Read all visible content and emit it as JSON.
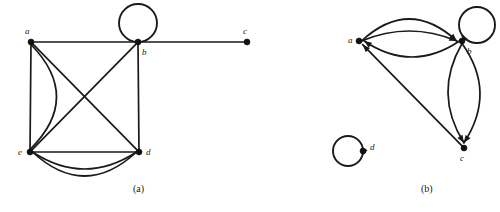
{
  "figure": {
    "panels": [
      {
        "id": "a",
        "caption": "(a)",
        "caption_x": 133,
        "caption_y": 183,
        "graph_type": "undirected multigraph",
        "vertices": [
          {
            "id": "a",
            "label": "a",
            "x": 31,
            "y": 42,
            "label_x": 25,
            "label_y": 27
          },
          {
            "id": "b",
            "label": "b",
            "x": 138,
            "y": 42,
            "label_x": 142,
            "label_y": 48
          },
          {
            "id": "c",
            "label": "c",
            "x": 247,
            "y": 42,
            "label_x": 243,
            "label_y": 27
          },
          {
            "id": "d",
            "label": "d",
            "x": 139,
            "y": 152,
            "label_x": 146,
            "label_y": 148
          },
          {
            "id": "e",
            "label": "e",
            "x": 30,
            "y": 152,
            "label_x": 18,
            "label_y": 148
          }
        ],
        "edges": [
          {
            "from": "a",
            "to": "b",
            "kind": "straight"
          },
          {
            "from": "b",
            "to": "c",
            "kind": "straight"
          },
          {
            "from": "a",
            "to": "e",
            "kind": "straight"
          },
          {
            "from": "a",
            "to": "e",
            "kind": "curve",
            "bow": -26
          },
          {
            "from": "a",
            "to": "d",
            "kind": "straight"
          },
          {
            "from": "b",
            "to": "e",
            "kind": "straight"
          },
          {
            "from": "b",
            "to": "d",
            "kind": "straight"
          },
          {
            "from": "e",
            "to": "d",
            "kind": "straight"
          },
          {
            "from": "e",
            "to": "d",
            "kind": "curve",
            "bow": 17
          },
          {
            "from": "e",
            "to": "d",
            "kind": "curve",
            "bow": 24
          }
        ],
        "loops": [
          {
            "at": "b",
            "cx": 138,
            "cy": 23,
            "r": 19
          }
        ]
      },
      {
        "id": "b",
        "caption": "(b)",
        "caption_x": 161,
        "caption_y": 183,
        "graph_type": "directed multigraph",
        "vertices": [
          {
            "id": "a",
            "label": "a",
            "x": 99,
            "y": 41,
            "label_x": 88,
            "label_y": 36
          },
          {
            "id": "b",
            "label": "b",
            "x": 202,
            "y": 41,
            "label_x": 207,
            "label_y": 47
          },
          {
            "id": "c",
            "label": "c",
            "x": 204,
            "y": 148,
            "label_x": 200,
            "label_y": 154
          },
          {
            "id": "d",
            "label": "d",
            "x": 103,
            "y": 151,
            "label_x": 110,
            "label_y": 143
          }
        ],
        "edges": [
          {
            "from": "a",
            "to": "b",
            "kind": "curve",
            "bow": -22,
            "directed": true
          },
          {
            "from": "a",
            "to": "b",
            "kind": "curve",
            "bow": -10,
            "directed": true
          },
          {
            "from": "b",
            "to": "a",
            "kind": "curve",
            "bow": -16,
            "directed": true
          },
          {
            "from": "b",
            "to": "c",
            "kind": "curve",
            "bow": -17,
            "directed": true
          },
          {
            "from": "b",
            "to": "c",
            "kind": "curve",
            "bow": 15,
            "directed": true
          },
          {
            "from": "c",
            "to": "a",
            "kind": "straight",
            "directed": true
          }
        ],
        "loops": [
          {
            "at": "b",
            "cx": 217,
            "cy": 25,
            "r": 18,
            "directed": true,
            "arrow_angle": 150
          },
          {
            "at": "d",
            "cx": 88,
            "cy": 151,
            "r": 15,
            "directed": true,
            "arrow_angle": 20
          }
        ]
      }
    ]
  }
}
